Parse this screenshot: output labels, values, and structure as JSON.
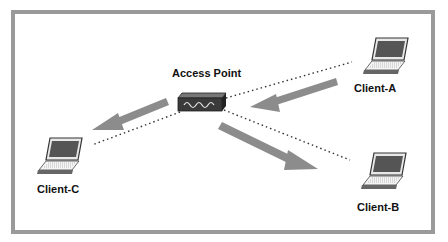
{
  "diagram": {
    "nodes": [
      {
        "id": "ap",
        "label": "Access Point",
        "type": "access-point"
      },
      {
        "id": "a",
        "label": "Client-A",
        "type": "laptop"
      },
      {
        "id": "b",
        "label": "Client-B",
        "type": "laptop"
      },
      {
        "id": "c",
        "label": "Client-C",
        "type": "laptop"
      }
    ],
    "links": [
      {
        "from": "a",
        "to": "ap",
        "style": "dotted"
      },
      {
        "from": "ap",
        "to": "b",
        "style": "dotted"
      },
      {
        "from": "ap",
        "to": "c",
        "style": "dotted"
      }
    ],
    "flow_arrows": [
      {
        "from": "a",
        "to": "ap"
      },
      {
        "from": "ap",
        "to": "b"
      },
      {
        "from": "ap",
        "to": "c"
      }
    ],
    "colors": {
      "border": "#9a9a9a",
      "arrow": "#8c8c8c",
      "device": "#333333"
    }
  }
}
